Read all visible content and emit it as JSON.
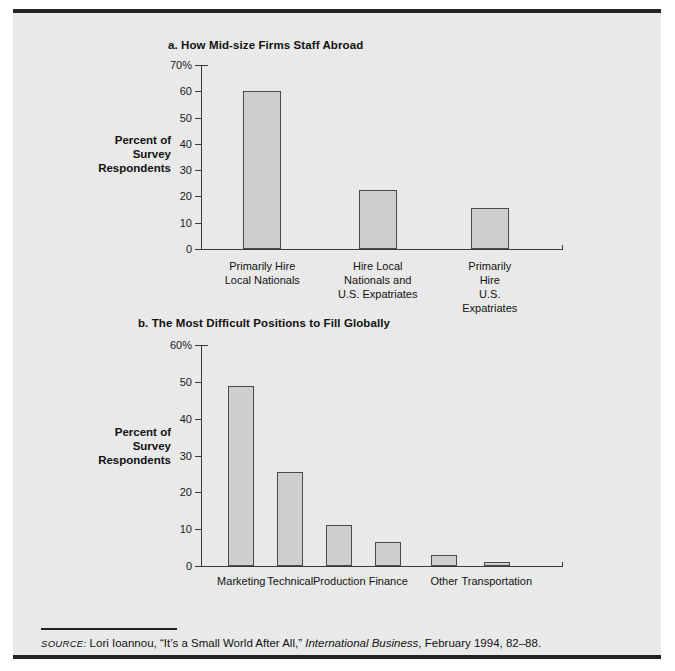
{
  "figure": {
    "source_label": "SOURCE:",
    "source_author": " Lori Ioannou, “It’s a Small World After All,” ",
    "source_publication": "International Business",
    "source_rest": ", February 1994, 82–88."
  },
  "chart_data": [
    {
      "id": "a",
      "type": "bar",
      "title": "a. How Mid-size Firms Staff Abroad",
      "categories": [
        "Primarily Hire\nLocal Nationals",
        "Hire Local\nNationals and\nU.S. Expatriates",
        "Primarily Hire\nU.S. Expatriates"
      ],
      "values": [
        60,
        22.5,
        15.5
      ],
      "xlabel": "",
      "ylabel": "Percent of\nSurvey\nRespondents",
      "ylim": [
        0,
        70
      ],
      "yticks": [
        0,
        10,
        20,
        30,
        40,
        50,
        60,
        70
      ],
      "ytick_labels": [
        "0",
        "10",
        "20",
        "30",
        "40",
        "50",
        "60",
        "70%"
      ],
      "grid": false,
      "legend": "none",
      "bar_color": "#cfcfcf",
      "bar_edge_color": "#4a4a4a"
    },
    {
      "id": "b",
      "type": "bar",
      "title": "b. The Most Difficult Positions to Fill Globally",
      "categories": [
        "Marketing",
        "Technical",
        "Production",
        "Finance",
        "Other",
        "Transportation"
      ],
      "values": [
        49,
        25.5,
        11,
        6.5,
        3,
        1
      ],
      "xlabel": "",
      "ylabel": "Percent of\nSurvey\nRespondents",
      "ylim": [
        0,
        60
      ],
      "yticks": [
        0,
        10,
        20,
        30,
        40,
        50,
        60
      ],
      "ytick_labels": [
        "0",
        "10",
        "20",
        "30",
        "40",
        "50",
        "60%"
      ],
      "grid": false,
      "legend": "none",
      "bar_color": "#cfcfcf",
      "bar_edge_color": "#4a4a4a"
    }
  ]
}
